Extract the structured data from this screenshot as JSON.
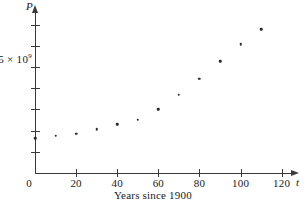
{
  "chart_data": {
    "type": "scatter",
    "title": "",
    "caption": "Years since 1900",
    "xlabel": "t",
    "ylabel": "P",
    "x": [
      0,
      10,
      20,
      30,
      40,
      50,
      60,
      70,
      80,
      90,
      100,
      110
    ],
    "values": [
      1.65,
      1.75,
      1.86,
      2.07,
      2.3,
      2.52,
      3.02,
      3.7,
      4.45,
      5.28,
      6.08,
      6.79
    ],
    "y_unit": "10^9",
    "xlim": [
      0,
      126
    ],
    "ylim": [
      0,
      7.6
    ],
    "xticks": [
      0,
      20,
      40,
      60,
      80,
      100,
      120
    ],
    "xtick_labels": [
      "0",
      "20",
      "40",
      "60",
      "80",
      "100",
      "120"
    ],
    "yticks": [
      1,
      2,
      3,
      4,
      5,
      6,
      7
    ],
    "ytick_labels": [
      "",
      "",
      "",
      "",
      "5 × 10⁹",
      "",
      ""
    ],
    "y_labeled_tick": {
      "value": 5,
      "mantissa": "5 × 10",
      "exponent": "9"
    },
    "grid": false,
    "legend": null,
    "marker": "dot",
    "marker_color": "#2a2a2a"
  },
  "axes": {
    "y_name": "P",
    "x_name": "t",
    "origin_label": "0"
  },
  "colors": {
    "axis": "#3a3a3a",
    "text": "#1a1a1a",
    "marker": "#2a2a2a",
    "background": "#ffffff"
  }
}
